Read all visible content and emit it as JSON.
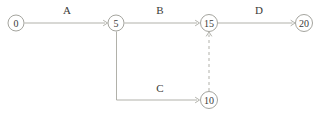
{
  "diagram": {
    "background_color": "#ffffff",
    "line_color": "#a8a8a0",
    "node_stroke_color": "#9a9a93",
    "text_color": "#3a3a38",
    "nodes": [
      {
        "id": "n0",
        "label": "0",
        "cx": 16,
        "cy": 23,
        "r": 8
      },
      {
        "id": "n5",
        "label": "5",
        "cx": 116,
        "cy": 23,
        "r": 8
      },
      {
        "id": "n15",
        "label": "15",
        "cx": 209,
        "cy": 23,
        "r": 8.5
      },
      {
        "id": "n20",
        "label": "20",
        "cx": 304,
        "cy": 23,
        "r": 8.5
      },
      {
        "id": "n10",
        "label": "10",
        "cx": 209,
        "cy": 100,
        "r": 8.5
      }
    ],
    "edges": [
      {
        "id": "e-a",
        "label": "A",
        "from": "n0",
        "to": "n5",
        "style": "solid",
        "label_x": 67,
        "label_y": 14
      },
      {
        "id": "e-b",
        "label": "B",
        "from": "n5",
        "to": "n15",
        "style": "solid",
        "label_x": 160,
        "label_y": 14
      },
      {
        "id": "e-d",
        "label": "D",
        "from": "n15",
        "to": "n20",
        "style": "solid",
        "label_x": 259,
        "label_y": 14
      },
      {
        "id": "e-c",
        "label": "C",
        "from": "n5",
        "to": "n10",
        "style": "elbow",
        "label_x": 160,
        "label_y": 92
      },
      {
        "id": "e-dummy",
        "label": "",
        "from": "n10",
        "to": "n15",
        "style": "dashed",
        "label_x": 0,
        "label_y": 0
      }
    ]
  }
}
